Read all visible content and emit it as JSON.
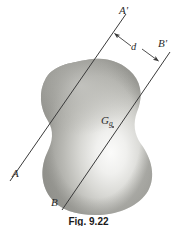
{
  "figure": {
    "caption": "Fig. 9.22",
    "background_color": "#ffffff",
    "line_color": "#3a3a3a",
    "blob_fill_light": "#f4f4f2",
    "blob_fill_mid": "#b9b9b5",
    "blob_fill_dark": "#8f8f8b",
    "labels": {
      "axis_a_prime": "A'",
      "axis_a": "A",
      "axis_b_prime": "B'",
      "axis_b": "B",
      "distance": "d",
      "centroid": "G",
      "centroid_subscript": "g"
    },
    "geometry": {
      "line_aa_prime": {
        "x1": 10,
        "y1": 181,
        "x2": 126,
        "y2": 14
      },
      "line_bb_prime": {
        "x1": 62,
        "y1": 210,
        "x2": 170,
        "y2": 52
      },
      "dimension_arrow_left": {
        "x1": 132,
        "y1": 46,
        "x2": 114,
        "y2": 33
      },
      "dimension_arrow_right": {
        "x1": 142,
        "y1": 49,
        "x2": 159,
        "y2": 61
      },
      "centroid_point": {
        "x": 113,
        "y": 127
      }
    }
  }
}
